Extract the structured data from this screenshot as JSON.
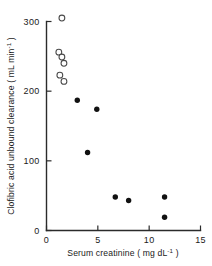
{
  "chart_data": {
    "type": "scatter",
    "title": "",
    "xlabel": "Serum creatinine ( mg dL⁻¹ )",
    "ylabel": "Clofibric acid unbound clearance ( mL min⁻¹ )",
    "xlim": [
      0,
      15
    ],
    "ylim": [
      0,
      300
    ],
    "xticks": [
      0,
      5,
      10,
      15
    ],
    "xtick_labels": [
      "0",
      "5",
      "10",
      "15"
    ],
    "yticks": [
      0,
      100,
      200,
      300
    ],
    "ytick_labels": [
      "0",
      "100",
      "200",
      "300"
    ],
    "grid": false,
    "legend": "none",
    "series": [
      {
        "name": "open-circles",
        "marker": "open-circle",
        "points": [
          {
            "x": 1.5,
            "y": 305
          },
          {
            "x": 1.2,
            "y": 256
          },
          {
            "x": 1.5,
            "y": 249
          },
          {
            "x": 1.7,
            "y": 240
          },
          {
            "x": 1.3,
            "y": 223
          },
          {
            "x": 1.7,
            "y": 214
          }
        ]
      },
      {
        "name": "filled-circles",
        "marker": "filled-circle",
        "points": [
          {
            "x": 3.0,
            "y": 187
          },
          {
            "x": 4.9,
            "y": 174
          },
          {
            "x": 4.0,
            "y": 112
          },
          {
            "x": 6.7,
            "y": 48
          },
          {
            "x": 8.0,
            "y": 43
          },
          {
            "x": 11.5,
            "y": 48
          },
          {
            "x": 11.5,
            "y": 19
          }
        ]
      }
    ]
  },
  "axis_labels": {
    "x_main": "Serum creatinine ( mg dL",
    "x_sup": "-1",
    "x_close": " )",
    "y_main": "Clofibric acid unbound clearance ( mL min",
    "y_sup": "-1",
    "y_close": " )"
  }
}
